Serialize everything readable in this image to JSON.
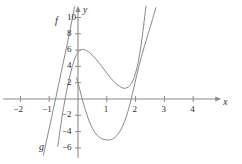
{
  "chart_data": {
    "type": "line",
    "title": "",
    "xlabel": "x",
    "ylabel": "y",
    "grid": false,
    "legend": "inline-curve-labels",
    "xlim": [
      -2.6,
      4.8
    ],
    "ylim": [
      -7.2,
      10.8
    ],
    "x_ticks": [
      -2,
      -1,
      1,
      2,
      3,
      4
    ],
    "y_ticks": [
      -6,
      -4,
      -2,
      2,
      4,
      6,
      8,
      10
    ],
    "x_tick_labels": [
      "−2",
      "−1",
      "1",
      "2",
      "3",
      "4"
    ],
    "y_tick_labels": [
      "−6",
      "−4",
      "−2",
      "2",
      "4",
      "6",
      "8",
      "10"
    ],
    "series": [
      {
        "name": "f",
        "label": "f",
        "color": "#8a8a8a",
        "description": "cubic curve: rises steeply from lower left, local maximum near (0.15, 6.1), decreases to local minimum near (1.6, 1.3), then rises steeply off the top of the frame near x = 2.2",
        "points": [
          [
            -0.7,
            -5.8
          ],
          [
            -0.6,
            -3.2
          ],
          [
            -0.5,
            -1.0
          ],
          [
            -0.4,
            0.9
          ],
          [
            -0.3,
            2.6
          ],
          [
            -0.2,
            4.0
          ],
          [
            -0.1,
            5.1
          ],
          [
            0.0,
            5.8
          ],
          [
            0.1,
            6.08
          ],
          [
            0.2,
            6.1
          ],
          [
            0.3,
            5.95
          ],
          [
            0.45,
            5.55
          ],
          [
            0.6,
            5.0
          ],
          [
            0.75,
            4.35
          ],
          [
            0.9,
            3.65
          ],
          [
            1.05,
            2.95
          ],
          [
            1.2,
            2.3
          ],
          [
            1.35,
            1.78
          ],
          [
            1.5,
            1.42
          ],
          [
            1.6,
            1.3
          ],
          [
            1.7,
            1.35
          ],
          [
            1.8,
            1.62
          ],
          [
            1.9,
            2.15
          ],
          [
            2.0,
            3.1
          ],
          [
            2.1,
            4.6
          ],
          [
            2.2,
            6.8
          ],
          [
            2.3,
            9.6
          ],
          [
            2.36,
            11.4
          ]
        ]
      },
      {
        "name": "g",
        "label": "g",
        "color": "#8a8a8a",
        "description": "parabola-like curve: comes down from upper left near the y-axis through y = 2 at x = 0, minimum near (1.1, -5.0), crosses the x-axis near x = 1.75 and rises steeply off the top of the frame near x = 2.7",
        "points": [
          [
            -0.05,
            2.6
          ],
          [
            0.0,
            2.0
          ],
          [
            0.1,
            0.6
          ],
          [
            0.2,
            -0.7
          ],
          [
            0.3,
            -1.85
          ],
          [
            0.4,
            -2.85
          ],
          [
            0.5,
            -3.6
          ],
          [
            0.6,
            -4.2
          ],
          [
            0.75,
            -4.75
          ],
          [
            0.9,
            -4.98
          ],
          [
            1.05,
            -5.05
          ],
          [
            1.2,
            -4.95
          ],
          [
            1.35,
            -4.55
          ],
          [
            1.5,
            -3.7
          ],
          [
            1.6,
            -2.95
          ],
          [
            1.7,
            -1.95
          ],
          [
            1.8,
            -0.7
          ],
          [
            1.9,
            0.8
          ],
          [
            2.05,
            3.1
          ],
          [
            2.2,
            5.2
          ],
          [
            2.4,
            7.6
          ],
          [
            2.6,
            9.9
          ],
          [
            2.7,
            11.2
          ]
        ]
      },
      {
        "name": "g-left-branch",
        "label": "",
        "color": "#8a8a8a",
        "description": "steep straight branch entering from lower left, passes x-axis just right of x = -1 and rises past y = 10 near x = -0.15",
        "points": [
          [
            -1.2,
            -6.9
          ],
          [
            -1.05,
            -4.4
          ],
          [
            -0.9,
            -2.0
          ],
          [
            -0.78,
            0.0
          ],
          [
            -0.6,
            3.0
          ],
          [
            -0.45,
            5.5
          ],
          [
            -0.3,
            8.0
          ],
          [
            -0.18,
            10.2
          ],
          [
            -0.12,
            11.3
          ]
        ]
      }
    ],
    "curve_labels": [
      {
        "text": "f",
        "x": -0.8,
        "y": 9.6
      },
      {
        "text": "g",
        "x": -1.35,
        "y": -5.9
      }
    ]
  },
  "axes": {
    "x_axis_label": "x",
    "y_axis_label": "y",
    "axis_color": "#8a8a8a",
    "arrow_x": "right",
    "arrow_y": "up"
  }
}
